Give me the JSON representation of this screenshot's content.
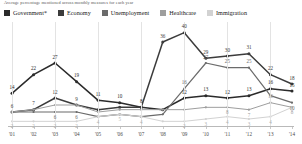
{
  "subtitle": "Average percentage mentioned across monthly measures for each year",
  "legend": {
    "items": [
      {
        "label": "Government*",
        "color": "#2b2b2b"
      },
      {
        "label": "Economy",
        "color": "#3c3c3c"
      },
      {
        "label": "Unemployment",
        "color": "#6b6b6b"
      },
      {
        "label": "Healthcare",
        "color": "#9e9e9e"
      },
      {
        "label": "Immigration",
        "color": "#d2d2d2"
      }
    ]
  },
  "chart_data": {
    "type": "line",
    "title": "",
    "subtitle": "Average percentage mentioned across monthly measures for each year",
    "xlabel": "",
    "ylabel": "",
    "grid": true,
    "legend_position": "top",
    "ylim": [
      0,
      42
    ],
    "categories": [
      "'01",
      "'02",
      "'03",
      "'04",
      "'05",
      "'06",
      "'07",
      "'08",
      "'09",
      "'10",
      "'11",
      "'12",
      "'13",
      "'14"
    ],
    "series": [
      {
        "name": "Government*",
        "color": "#2b2b2b",
        "values": [
          14,
          22,
          27,
          19,
          11,
          10,
          8,
          7,
          12,
          13,
          12,
          13,
          16,
          15
        ]
      },
      {
        "name": "Economy",
        "color": "#3c3c3c",
        "values": [
          6,
          7,
          12,
          9,
          7,
          8,
          8,
          36,
          40,
          29,
          30,
          31,
          22,
          18
        ]
      },
      {
        "name": "Unemployment",
        "color": "#6b6b6b",
        "values": [
          6,
          6,
          6,
          6,
          4,
          5,
          4,
          5,
          16,
          27,
          25,
          25,
          13,
          10
        ]
      },
      {
        "name": "Healthcare",
        "color": "#9e9e9e",
        "values": [
          6,
          7,
          9,
          9,
          6,
          7,
          7,
          7,
          7,
          8,
          8,
          7,
          10,
          8
        ]
      },
      {
        "name": "Immigration",
        "color": "#d2d2d2",
        "values": [
          2,
          2,
          2,
          2,
          4,
          5,
          4,
          2,
          2,
          3,
          4,
          3,
          4,
          8
        ]
      }
    ],
    "point_labels": [
      {
        "series": "Government*",
        "x": "'01",
        "value": 14
      },
      {
        "series": "Government*",
        "x": "'02",
        "value": 22
      },
      {
        "series": "Government*",
        "x": "'03",
        "value": 27
      },
      {
        "series": "Government*",
        "x": "'04",
        "value": 19
      },
      {
        "series": "Government*",
        "x": "'05",
        "value": 11
      },
      {
        "series": "Government*",
        "x": "'06",
        "value": 10
      },
      {
        "series": "Government*",
        "x": "'07",
        "value": 8
      },
      {
        "series": "Government*",
        "x": "'09",
        "value": 12
      },
      {
        "series": "Government*",
        "x": "'10",
        "value": 13
      },
      {
        "series": "Government*",
        "x": "'11",
        "value": 12
      },
      {
        "series": "Government*",
        "x": "'12",
        "value": 13
      },
      {
        "series": "Government*",
        "x": "'13",
        "value": 16
      },
      {
        "series": "Government*",
        "x": "'14",
        "value": 15
      },
      {
        "series": "Economy",
        "x": "'01",
        "value": 6
      },
      {
        "series": "Economy",
        "x": "'02",
        "value": 7
      },
      {
        "series": "Economy",
        "x": "'03",
        "value": 12
      },
      {
        "series": "Economy",
        "x": "'04",
        "value": 9
      },
      {
        "series": "Economy",
        "x": "'08",
        "value": 36
      },
      {
        "series": "Economy",
        "x": "'09",
        "value": 40
      },
      {
        "series": "Economy",
        "x": "'10",
        "value": 29
      },
      {
        "series": "Economy",
        "x": "'11",
        "value": 30
      },
      {
        "series": "Economy",
        "x": "'12",
        "value": 31
      },
      {
        "series": "Economy",
        "x": "'13",
        "value": 22
      },
      {
        "series": "Economy",
        "x": "'14",
        "value": 18
      },
      {
        "series": "Unemployment",
        "x": "'03",
        "value": 6
      },
      {
        "series": "Unemployment",
        "x": "'04",
        "value": 6
      },
      {
        "series": "Unemployment",
        "x": "'09",
        "value": 16
      },
      {
        "series": "Unemployment",
        "x": "'10",
        "value": 27
      },
      {
        "series": "Unemployment",
        "x": "'11",
        "value": 25
      },
      {
        "series": "Unemployment",
        "x": "'12",
        "value": 25
      },
      {
        "series": "Unemployment",
        "x": "'14",
        "value": 10
      },
      {
        "series": "Healthcare",
        "x": "'11",
        "value": 8
      },
      {
        "series": "Healthcare",
        "x": "'12",
        "value": 7
      },
      {
        "series": "Healthcare",
        "x": "'13",
        "value": 10
      },
      {
        "series": "Healthcare",
        "x": "'14",
        "value": 8
      },
      {
        "series": "Immigration",
        "x": "'01",
        "value": 2
      },
      {
        "series": "Immigration",
        "x": "'02",
        "value": 2
      },
      {
        "series": "Immigration",
        "x": "'03",
        "value": 2
      },
      {
        "series": "Immigration",
        "x": "'04",
        "value": 2
      },
      {
        "series": "Immigration",
        "x": "'05",
        "value": 4
      },
      {
        "series": "Immigration",
        "x": "'06",
        "value": 5
      },
      {
        "series": "Immigration",
        "x": "'07",
        "value": 4
      },
      {
        "series": "Immigration",
        "x": "'09",
        "value": 2
      },
      {
        "series": "Immigration",
        "x": "'10",
        "value": 3
      },
      {
        "series": "Immigration",
        "x": "'11",
        "value": 4
      },
      {
        "series": "Immigration",
        "x": "'12",
        "value": 3
      },
      {
        "series": "Immigration",
        "x": "'13",
        "value": 4
      }
    ]
  }
}
